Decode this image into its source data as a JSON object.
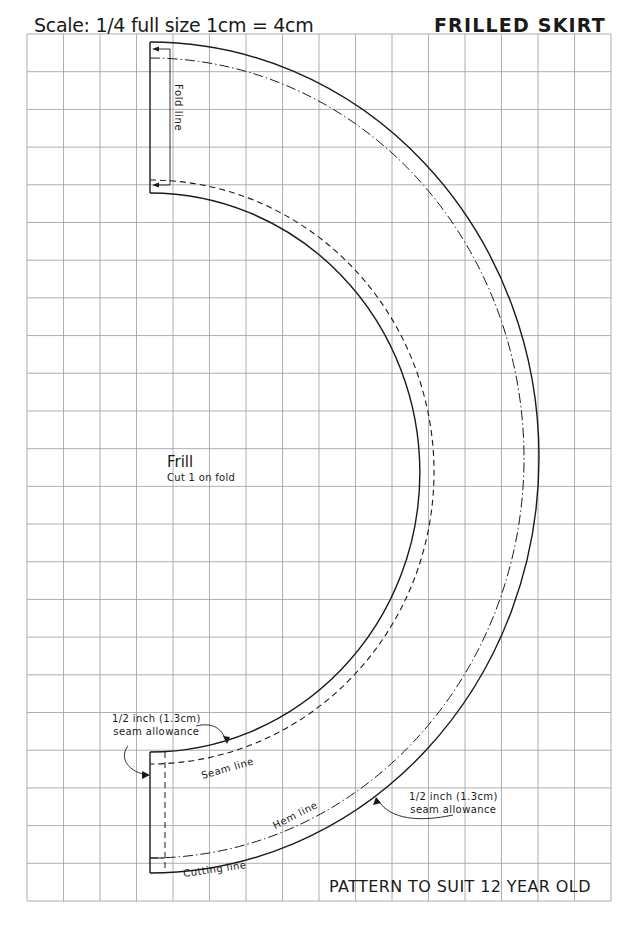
{
  "header": {
    "scale_text": "Scale: 1/4 full size  1cm = 4cm",
    "title": "FRILLED SKIRT"
  },
  "piece": {
    "name": "Frill",
    "instruction": "Cut 1 on fold"
  },
  "labels": {
    "fold_line": "Fold line",
    "seam_line": "Seam line",
    "hem_line": "Hem line",
    "cutting_line": "Cutting line"
  },
  "annotations": {
    "seam_allowance_left": {
      "line1": "1/2 inch (1.3cm)",
      "line2": "seam allowance"
    },
    "seam_allowance_right": {
      "line1": "1/2 inch (1.3cm)",
      "line2": "seam allowance"
    }
  },
  "footer": {
    "text": "PATTERN TO SUIT 12 YEAR OLD"
  },
  "grid": {
    "left": 27,
    "right": 611,
    "top": 34,
    "bottom": 901,
    "columns": 16,
    "rows": 23,
    "line_color": "#9a9a9a"
  },
  "colors": {
    "ink": "#1a1a1a",
    "paper": "#ffffff",
    "grid": "#9a9a9a"
  }
}
